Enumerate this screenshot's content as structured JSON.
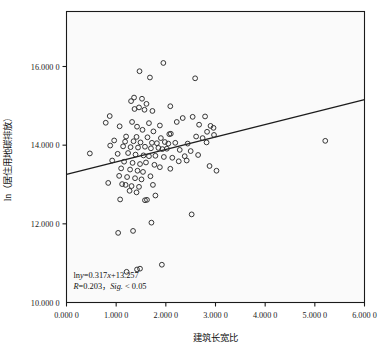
{
  "chart_data": {
    "type": "scatter",
    "title": "",
    "xlabel": "建筑长宽比",
    "ylabel": "ln（居住用地碳排放）",
    "xlim": [
      0.0,
      6.0
    ],
    "ylim": [
      10.0,
      16.0
    ],
    "grid": false,
    "legend": null,
    "xticks": [
      "0.000 0",
      "1.000 0",
      "2.000 0",
      "3.000 0",
      "4.000 0",
      "5.000 0",
      "6.000 0"
    ],
    "xtick_values": [
      0.0,
      1.0,
      2.0,
      3.0,
      4.0,
      5.0,
      6.0
    ],
    "yticks": [
      "10.000 0",
      "12.000 0",
      "14.000 0",
      "16.000 0"
    ],
    "ytick_values": [
      10.0,
      12.0,
      14.0,
      16.0
    ],
    "marker": {
      "shape": "open-circle",
      "radius": 2.4,
      "stroke": "#2b2b2b",
      "fill": "none"
    },
    "trendline": {
      "type": "line",
      "slope": 0.317,
      "intercept": 13.257,
      "x_start": 0.0,
      "x_end": 6.0,
      "y_start": 13.257,
      "y_end": 15.159,
      "color": "#1c1c1c",
      "width": 1.3
    },
    "annotations": [
      {
        "id": "equation",
        "text": "lny=0.317x+13.257",
        "x": 0.1,
        "y": 10.62
      },
      {
        "id": "stats",
        "text": "R=0.203，Sig. < 0.05",
        "x": 0.1,
        "y": 10.34
      }
    ],
    "annotation_parts": {
      "eq_prefix": "ln",
      "eq_var": "y",
      "eq_mid": "=0.317",
      "eq_x": "x",
      "eq_suffix": "+13.257",
      "stat_r": "R",
      "stat_r_val": "=0.203，",
      "stat_sig": "Sig.",
      "stat_sig_val": " < 0.05"
    },
    "points": [
      [
        1.95,
        16.09
      ],
      [
        1.47,
        15.88
      ],
      [
        1.68,
        15.72
      ],
      [
        2.59,
        15.7
      ],
      [
        1.36,
        15.21
      ],
      [
        1.52,
        15.18
      ],
      [
        1.3,
        15.12
      ],
      [
        1.61,
        15.05
      ],
      [
        2.09,
        14.99
      ],
      [
        1.46,
        14.96
      ],
      [
        1.37,
        14.92
      ],
      [
        1.57,
        14.9
      ],
      [
        1.73,
        14.87
      ],
      [
        0.87,
        14.74
      ],
      [
        2.54,
        14.72
      ],
      [
        2.34,
        14.69
      ],
      [
        2.79,
        14.73
      ],
      [
        0.79,
        14.57
      ],
      [
        1.32,
        14.59
      ],
      [
        1.66,
        14.56
      ],
      [
        2.22,
        14.59
      ],
      [
        2.67,
        14.52
      ],
      [
        1.07,
        14.48
      ],
      [
        1.42,
        14.47
      ],
      [
        1.88,
        14.5
      ],
      [
        2.9,
        14.49
      ],
      [
        2.96,
        14.44
      ],
      [
        1.53,
        14.39
      ],
      [
        1.75,
        14.35
      ],
      [
        2.07,
        14.28
      ],
      [
        2.1,
        14.29
      ],
      [
        2.83,
        14.34
      ],
      [
        2.97,
        14.26
      ],
      [
        1.2,
        14.22
      ],
      [
        1.41,
        14.21
      ],
      [
        1.63,
        14.2
      ],
      [
        1.9,
        14.18
      ],
      [
        2.61,
        14.22
      ],
      [
        2.74,
        14.18
      ],
      [
        0.96,
        14.12
      ],
      [
        1.18,
        14.09
      ],
      [
        1.35,
        14.1
      ],
      [
        1.49,
        14.07
      ],
      [
        1.72,
        14.06
      ],
      [
        1.82,
        14.05
      ],
      [
        1.98,
        14.08
      ],
      [
        2.05,
        14.04
      ],
      [
        2.19,
        14.06
      ],
      [
        2.44,
        14.04
      ],
      [
        2.82,
        14.07
      ],
      [
        5.21,
        14.11
      ],
      [
        0.88,
        13.99
      ],
      [
        1.14,
        13.97
      ],
      [
        1.29,
        13.95
      ],
      [
        1.44,
        13.94
      ],
      [
        1.58,
        13.96
      ],
      [
        1.7,
        13.92
      ],
      [
        1.85,
        13.93
      ],
      [
        1.93,
        13.9
      ],
      [
        2.02,
        13.91
      ],
      [
        2.28,
        13.88
      ],
      [
        2.5,
        13.85
      ],
      [
        0.47,
        13.79
      ],
      [
        1.03,
        13.78
      ],
      [
        1.24,
        13.8
      ],
      [
        1.39,
        13.76
      ],
      [
        1.55,
        13.74
      ],
      [
        1.66,
        13.72
      ],
      [
        1.79,
        13.73
      ],
      [
        1.96,
        13.7
      ],
      [
        2.13,
        13.68
      ],
      [
        2.38,
        13.72
      ],
      [
        2.65,
        13.75
      ],
      [
        0.92,
        13.61
      ],
      [
        1.16,
        13.58
      ],
      [
        1.33,
        13.55
      ],
      [
        1.48,
        13.52
      ],
      [
        1.6,
        13.56
      ],
      [
        1.77,
        13.5
      ],
      [
        2.26,
        13.59
      ],
      [
        2.42,
        13.61
      ],
      [
        1.1,
        13.41
      ],
      [
        1.28,
        13.38
      ],
      [
        1.43,
        13.35
      ],
      [
        1.54,
        13.32
      ],
      [
        1.88,
        13.44
      ],
      [
        2.09,
        13.4
      ],
      [
        2.88,
        13.47
      ],
      [
        3.02,
        13.35
      ],
      [
        1.06,
        13.22
      ],
      [
        1.22,
        13.19
      ],
      [
        1.38,
        13.16
      ],
      [
        1.51,
        13.13
      ],
      [
        1.69,
        13.21
      ],
      [
        0.84,
        13.04
      ],
      [
        1.12,
        13.01
      ],
      [
        1.19,
        12.99
      ],
      [
        1.31,
        12.96
      ],
      [
        1.46,
        12.94
      ],
      [
        1.74,
        12.99
      ],
      [
        1.27,
        12.84
      ],
      [
        1.41,
        12.8
      ],
      [
        1.08,
        12.62
      ],
      [
        1.58,
        12.6
      ],
      [
        1.62,
        12.61
      ],
      [
        1.79,
        12.72
      ],
      [
        2.52,
        12.24
      ],
      [
        1.71,
        12.03
      ],
      [
        1.04,
        11.77
      ],
      [
        1.34,
        11.82
      ],
      [
        1.92,
        10.96
      ],
      [
        1.21,
        10.78
      ],
      [
        1.42,
        10.84
      ],
      [
        1.48,
        10.86
      ]
    ]
  },
  "axes": {
    "frame_color": "#1a1a1a",
    "plot_bg": "#fafafa",
    "tick_color": "#1a1a1a"
  }
}
